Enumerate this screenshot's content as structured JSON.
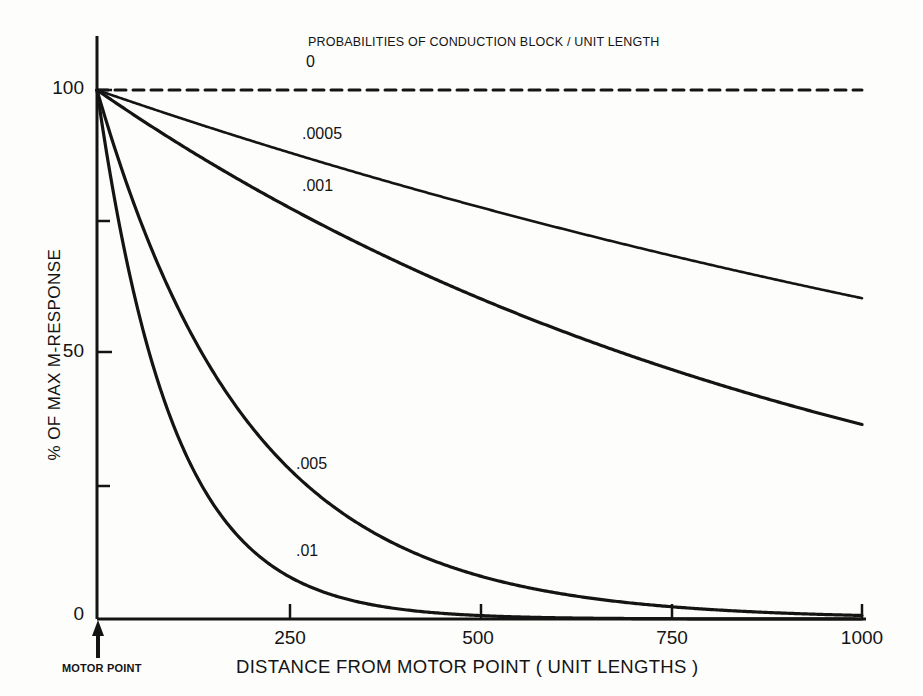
{
  "chart_data": {
    "type": "line",
    "title": "PROBABILITIES OF CONDUCTION BLOCK / UNIT LENGTH",
    "xlabel": "DISTANCE FROM MOTOR POINT ( UNIT LENGTHS )",
    "ylabel": "% OF MAX M-RESPONSE",
    "xlim": [
      0,
      1000
    ],
    "ylim": [
      0,
      100
    ],
    "xticks": [
      0,
      250,
      500,
      750,
      1000
    ],
    "xtick_labels": [
      "0",
      "250",
      "500",
      "750",
      "1000"
    ],
    "yticks": [
      0,
      50,
      100
    ],
    "ytick_labels": [
      "0",
      "50",
      "100"
    ],
    "yticks_minor": [
      25,
      75
    ],
    "grid": false,
    "legend_position": "inline-curve-labels",
    "annotations": [
      {
        "text": "MOTOR POINT",
        "x": 0,
        "y": 0,
        "marker": "up-arrow"
      }
    ],
    "series": [
      {
        "name": "0",
        "label": ".0",
        "display_label": "0",
        "style": "dashed",
        "probability": 0,
        "x": [
          0,
          100,
          200,
          300,
          400,
          500,
          600,
          700,
          800,
          900,
          1000
        ],
        "values": [
          100,
          100,
          100,
          100,
          100,
          100,
          100,
          100,
          100,
          100,
          100
        ]
      },
      {
        "name": ".0005",
        "display_label": ".0005",
        "style": "solid",
        "probability": 0.0005,
        "x": [
          0,
          100,
          200,
          300,
          400,
          500,
          600,
          700,
          800,
          900,
          1000
        ],
        "values": [
          100,
          95.1,
          90.5,
          86.1,
          81.9,
          77.9,
          74.1,
          70.5,
          67.0,
          63.8,
          60.6
        ]
      },
      {
        "name": ".001",
        "display_label": ".001",
        "style": "solid",
        "probability": 0.001,
        "x": [
          0,
          100,
          200,
          300,
          400,
          500,
          600,
          700,
          800,
          900,
          1000
        ],
        "values": [
          100,
          90.5,
          81.9,
          74.1,
          67.0,
          60.6,
          54.9,
          49.7,
          44.9,
          40.7,
          36.8
        ]
      },
      {
        "name": ".005",
        "display_label": ".005",
        "style": "solid",
        "probability": 0.005,
        "x": [
          0,
          100,
          200,
          300,
          400,
          500,
          600,
          700,
          800,
          900,
          1000
        ],
        "values": [
          100,
          60.6,
          36.7,
          22.2,
          13.4,
          8.1,
          4.9,
          3.0,
          1.8,
          1.1,
          0.7
        ]
      },
      {
        "name": ".01",
        "display_label": ".01",
        "style": "solid",
        "probability": 0.01,
        "x": [
          0,
          100,
          200,
          300,
          400,
          500,
          600,
          700,
          800,
          900,
          1000
        ],
        "values": [
          100,
          36.6,
          13.4,
          4.9,
          1.8,
          0.7,
          0.2,
          0.1,
          0.0,
          0.0,
          0.0
        ]
      }
    ]
  },
  "labels": {
    "title": "PROBABILITIES OF CONDUCTION BLOCK / UNIT LENGTH",
    "y_axis_title": "% OF MAX M-RESPONSE",
    "x_axis_title": "DISTANCE FROM MOTOR POINT ( UNIT LENGTHS )",
    "motor_point": "MOTOR POINT",
    "series_0": "0",
    "series_0005": ".0005",
    "series_001": ".001",
    "series_005": ".005",
    "series_01": ".01",
    "ytick_100": "100",
    "ytick_50": "50",
    "ytick_0": "0",
    "xtick_250": "250",
    "xtick_500": "500",
    "xtick_750": "750",
    "xtick_1000": "1000"
  },
  "colors": {
    "ink": "#141414",
    "paper": "#fdfdfb"
  }
}
